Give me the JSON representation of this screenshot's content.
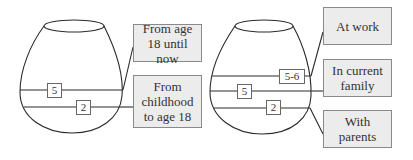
{
  "diagram": {
    "left_vase": {
      "levels": [
        {
          "value": "5",
          "label": "From age 18 until now"
        },
        {
          "value": "2",
          "label": "From childhood to age 18"
        }
      ],
      "labels": {
        "upper": "From age 18 until now",
        "lower": "From childhood to age 18"
      },
      "numbers": {
        "upper": "5",
        "lower": "2"
      }
    },
    "right_vase": {
      "levels": [
        {
          "value": "5-6",
          "label": "At work"
        },
        {
          "value": "5",
          "label": "In current family"
        },
        {
          "value": "2",
          "label": "With parents"
        }
      ],
      "labels": {
        "top": "At work",
        "middle": "In current family",
        "bottom": "With parents"
      },
      "numbers": {
        "top": "5-6",
        "middle": "5",
        "bottom": "2"
      }
    },
    "colors": {
      "line": "#2a2a2a",
      "label_fill": "#ececec",
      "label_border": "#8a8a8a"
    }
  }
}
